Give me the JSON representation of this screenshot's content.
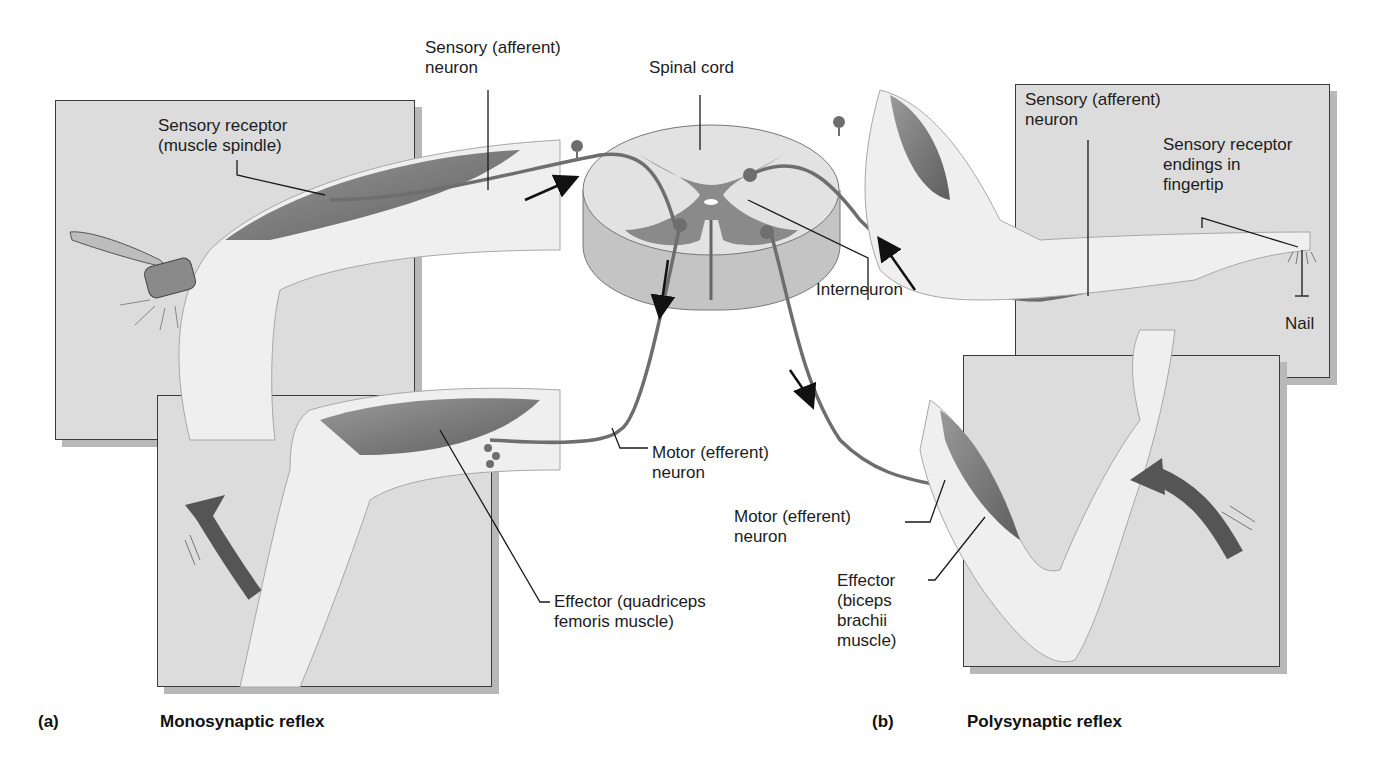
{
  "figure": {
    "panels": [
      {
        "id": "a",
        "letter": "(a)",
        "title": "Monosynaptic reflex",
        "labels": {
          "sensory_neuron": "Sensory (afferent)\nneuron",
          "sensory_receptor": "Sensory receptor\n(muscle spindle)",
          "motor_neuron": "Motor (efferent)\nneuron",
          "effector": "Effector (quadriceps\nfemoris muscle)"
        }
      },
      {
        "id": "b",
        "letter": "(b)",
        "title": "Polysynaptic reflex",
        "labels": {
          "sensory_neuron": "Sensory (afferent)\nneuron",
          "sensory_receptor": "Sensory receptor\nendings in\nfingertip",
          "stimulus": "Nail",
          "interneuron": "Interneuron",
          "motor_neuron": "Motor (efferent)\nneuron",
          "effector": "Effector\n(biceps\nbrachii\nmuscle)"
        }
      }
    ],
    "center": {
      "spinal_cord": "Spinal cord"
    },
    "colors": {
      "panel_bg": "#dcdcdc",
      "neuron": "#6e6e6e",
      "gray_matter": "#8a8a8a",
      "white_matter": "#e2e2e2",
      "muscle": "#7a7a7a",
      "skin": "#efefef",
      "arrow_big": "#555555"
    }
  }
}
